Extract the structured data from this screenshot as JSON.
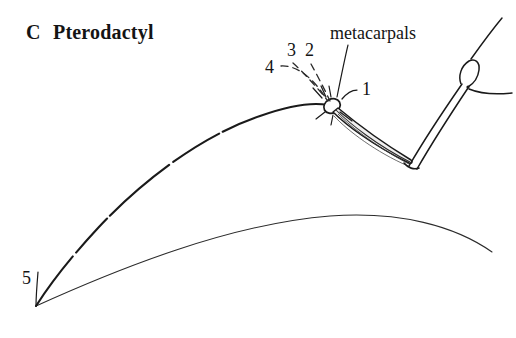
{
  "figure": {
    "panel_letter": "C",
    "title": "Pterodactyl",
    "full_title": "C  Pterodactyl",
    "background_color": "#ffffff",
    "ink_color": "#141414"
  },
  "labels": {
    "metacarpals": "metacarpals",
    "digit_1": "1",
    "digit_2": "2",
    "digit_3": "3",
    "digit_4": "4",
    "digit_5": "5"
  },
  "anatomy": {
    "wing_finger_label": "wing-finger-leading-edge",
    "membrane_label": "wing-membrane-trailing-edge",
    "wrist_label": "wrist-carpal-knob",
    "metacarpal_shaft_label": "metacarpal-bundle",
    "forearm_label": "forearm-radius-ulna",
    "humerus_label": "humerus",
    "body_label": "body-outline"
  }
}
